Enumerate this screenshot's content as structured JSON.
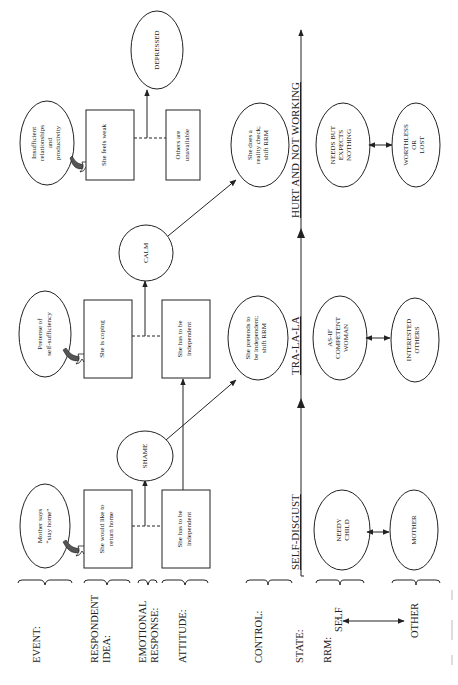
{
  "row_labels": {
    "event": "EVENT:",
    "respondent_idea_1": "RESPONDENT",
    "respondent_idea_2": "IDEA:",
    "emotional_response_1": "EMOTIONAL",
    "emotional_response_2": "RESPONSE:",
    "attitude": "ATTITUDE:",
    "control": "CONTROL:",
    "state": "STATE:",
    "rrm": "RRM:",
    "self": "SELF",
    "other": "OTHER"
  },
  "columns": [
    {
      "event": [
        "Mother says",
        "“stay home”"
      ],
      "idea": [
        "She would like to",
        "return home"
      ],
      "emotion": "SHAME",
      "attitude": [
        "She has to be",
        "independent"
      ],
      "control": null,
      "state": "SELF-DISGUST",
      "rrm_self": [
        "NEEDY",
        "CHILD"
      ],
      "rrm_other": [
        "MOTHER"
      ]
    },
    {
      "event": [
        "Pretense of",
        "self-sufficiency"
      ],
      "idea": [
        "She is coping"
      ],
      "emotion": "CALM",
      "attitude": [
        "She has to be",
        "independent"
      ],
      "control": [
        "She pretends to",
        "be independent;",
        "shift RRM"
      ],
      "state": "TRA-LA-LA",
      "rrm_self": [
        "AS-IF",
        "COMPETENT",
        "WOMAN"
      ],
      "rrm_other": [
        "INTERESTED",
        "OTHERS"
      ]
    },
    {
      "event": [
        "Insufficient",
        "relationships",
        "and",
        "productivity"
      ],
      "idea": [
        "She feels weak"
      ],
      "emotion": "DEPRESSED",
      "attitude": [
        "Others are",
        "unavailable"
      ],
      "control": [
        "She does a",
        "reality check;",
        "shift RRM"
      ],
      "state": "HURT AND NOT WORKING",
      "rrm_self": [
        "NEEDS BUT",
        "EXPECTS",
        "NOTHING"
      ],
      "rrm_other": [
        "WORTHLESS",
        "OR",
        "LOST"
      ]
    }
  ]
}
